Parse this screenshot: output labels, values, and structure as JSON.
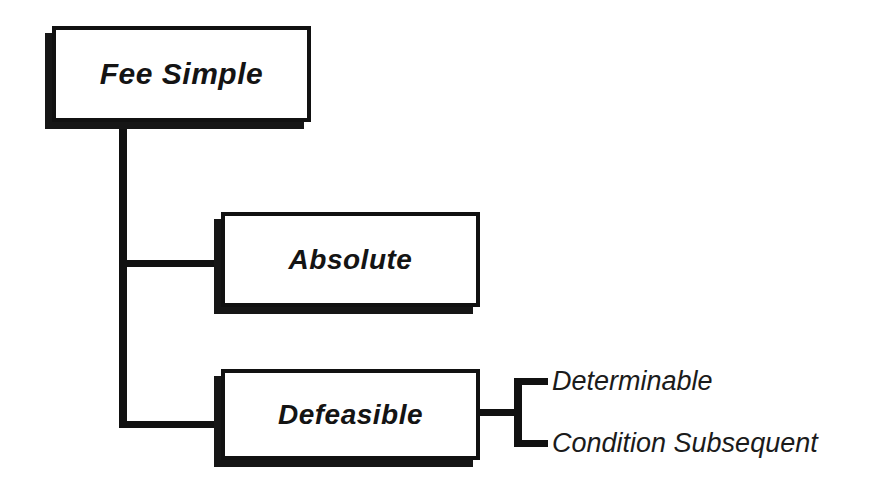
{
  "diagram": {
    "type": "hierarchy-tree",
    "background_color": "#ffffff",
    "line_color": "#111111",
    "text_color": "#141414",
    "root": {
      "label": "Fee Simple",
      "style": "boxed-bold-italic"
    },
    "children": [
      {
        "label": "Absolute",
        "style": "boxed-bold-italic",
        "children": []
      },
      {
        "label": "Defeasible",
        "style": "boxed-bold-italic",
        "children": [
          {
            "label": "Determinable",
            "style": "plain-italic"
          },
          {
            "label": "Condition Subsequent",
            "style": "plain-italic"
          }
        ]
      }
    ]
  }
}
